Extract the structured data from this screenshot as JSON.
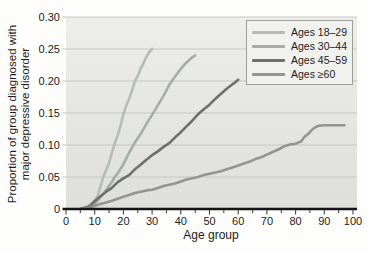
{
  "figure": {
    "ylabel_line1": "Proportion of group diagnosed with",
    "ylabel_line2": "major depressive disorder",
    "xlabel": "Age group"
  },
  "colors": {
    "plot_bg_top": "#ededea",
    "plot_bg_bottom": "#dededa",
    "gridline": "#c6c8c4",
    "axis_line": "#151515",
    "tick": "#333333",
    "text": "#1c1c1c",
    "legend_bg": "#f1f1ee",
    "legend_border": "#9d9d9a"
  },
  "chart_data": {
    "type": "line",
    "title": "",
    "xlabel": "Age group",
    "ylabel": "Proportion of group diagnosed with major depressive disorder",
    "xlim": [
      0,
      100
    ],
    "ylim": [
      0,
      0.3
    ],
    "x_tick_values": [
      0,
      10,
      20,
      30,
      40,
      50,
      60,
      70,
      80,
      90,
      100
    ],
    "x_tick_labels": [
      "0",
      "10",
      "20",
      "30",
      "40",
      "50",
      "60",
      "70",
      "80",
      "90",
      "100"
    ],
    "x_minor_tick_step": 5,
    "y_tick_values": [
      0,
      0.05,
      0.1,
      0.15,
      0.2,
      0.25,
      0.3
    ],
    "y_tick_labels": [
      "0",
      "0.05",
      "0.10",
      "0.15",
      "0.20",
      "0.25",
      "0.30"
    ],
    "grid": "horizontal",
    "legend_position": "top-right",
    "series": [
      {
        "name": "Ages 18–29",
        "color": "#b5bcb4",
        "points": [
          [
            5,
            0
          ],
          [
            7,
            0.002
          ],
          [
            9,
            0.008
          ],
          [
            11,
            0.02
          ],
          [
            13,
            0.05
          ],
          [
            15,
            0.072
          ],
          [
            17,
            0.103
          ],
          [
            18,
            0.115
          ],
          [
            19,
            0.13
          ],
          [
            20,
            0.148
          ],
          [
            21,
            0.162
          ],
          [
            22,
            0.172
          ],
          [
            23,
            0.185
          ],
          [
            24,
            0.2
          ],
          [
            25,
            0.208
          ],
          [
            26,
            0.219
          ],
          [
            27,
            0.228
          ],
          [
            28,
            0.238
          ],
          [
            29,
            0.245
          ],
          [
            30,
            0.25
          ]
        ]
      },
      {
        "name": "Ages 30–44",
        "color": "#a6ada3",
        "points": [
          [
            5,
            0
          ],
          [
            8,
            0.003
          ],
          [
            10,
            0.008
          ],
          [
            12,
            0.018
          ],
          [
            14,
            0.03
          ],
          [
            16,
            0.042
          ],
          [
            17,
            0.05
          ],
          [
            18,
            0.056
          ],
          [
            20,
            0.07
          ],
          [
            22,
            0.088
          ],
          [
            23,
            0.096
          ],
          [
            24,
            0.104
          ],
          [
            26,
            0.117
          ],
          [
            28,
            0.133
          ],
          [
            30,
            0.147
          ],
          [
            32,
            0.162
          ],
          [
            34,
            0.177
          ],
          [
            36,
            0.194
          ],
          [
            38,
            0.207
          ],
          [
            40,
            0.219
          ],
          [
            42,
            0.229
          ],
          [
            44,
            0.237
          ],
          [
            45,
            0.24
          ]
        ]
      },
      {
        "name": "Ages 45–59",
        "color": "#6e706c",
        "points": [
          [
            5,
            0
          ],
          [
            8,
            0.004
          ],
          [
            10,
            0.012
          ],
          [
            12,
            0.02
          ],
          [
            14,
            0.027
          ],
          [
            16,
            0.033
          ],
          [
            18,
            0.042
          ],
          [
            20,
            0.048
          ],
          [
            22,
            0.053
          ],
          [
            24,
            0.062
          ],
          [
            26,
            0.069
          ],
          [
            28,
            0.077
          ],
          [
            30,
            0.084
          ],
          [
            32,
            0.09
          ],
          [
            34,
            0.097
          ],
          [
            36,
            0.103
          ],
          [
            38,
            0.112
          ],
          [
            40,
            0.12
          ],
          [
            42,
            0.129
          ],
          [
            44,
            0.138
          ],
          [
            46,
            0.148
          ],
          [
            48,
            0.156
          ],
          [
            50,
            0.163
          ],
          [
            52,
            0.172
          ],
          [
            54,
            0.18
          ],
          [
            56,
            0.188
          ],
          [
            58,
            0.195
          ],
          [
            59,
            0.198
          ],
          [
            60,
            0.202
          ]
        ]
      },
      {
        "name": "Ages ≥60",
        "color": "#93968f",
        "points": [
          [
            5,
            0
          ],
          [
            8,
            0.002
          ],
          [
            10,
            0.005
          ],
          [
            12,
            0.008
          ],
          [
            14,
            0.01
          ],
          [
            16,
            0.013
          ],
          [
            18,
            0.016
          ],
          [
            20,
            0.019
          ],
          [
            22,
            0.022
          ],
          [
            24,
            0.025
          ],
          [
            26,
            0.027
          ],
          [
            28,
            0.029
          ],
          [
            30,
            0.03
          ],
          [
            32,
            0.033
          ],
          [
            34,
            0.036
          ],
          [
            36,
            0.038
          ],
          [
            38,
            0.04
          ],
          [
            40,
            0.043
          ],
          [
            42,
            0.046
          ],
          [
            44,
            0.048
          ],
          [
            46,
            0.05
          ],
          [
            48,
            0.053
          ],
          [
            50,
            0.055
          ],
          [
            52,
            0.057
          ],
          [
            54,
            0.059
          ],
          [
            56,
            0.062
          ],
          [
            58,
            0.065
          ],
          [
            60,
            0.068
          ],
          [
            62,
            0.071
          ],
          [
            64,
            0.074
          ],
          [
            66,
            0.078
          ],
          [
            68,
            0.081
          ],
          [
            70,
            0.085
          ],
          [
            72,
            0.089
          ],
          [
            74,
            0.093
          ],
          [
            76,
            0.098
          ],
          [
            78,
            0.101
          ],
          [
            80,
            0.102
          ],
          [
            81,
            0.104
          ],
          [
            82,
            0.106
          ],
          [
            83,
            0.112
          ],
          [
            84,
            0.116
          ],
          [
            85,
            0.12
          ],
          [
            86,
            0.125
          ],
          [
            87,
            0.128
          ],
          [
            88,
            0.13
          ],
          [
            90,
            0.131
          ],
          [
            93,
            0.131
          ],
          [
            97,
            0.131
          ]
        ]
      }
    ]
  }
}
